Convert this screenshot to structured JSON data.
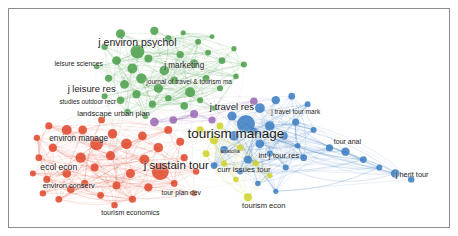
{
  "app": {
    "title": "VOSviewer co-citation network map",
    "frame_border_color": "#8c8c8c",
    "background_color": "#ffffff"
  },
  "clusters": [
    {
      "id": "green",
      "name": "psychology-marketing-cluster",
      "color": "#4da14d"
    },
    {
      "id": "red",
      "name": "environment-sustainability-cluster",
      "color": "#e04a2f"
    },
    {
      "id": "blue",
      "name": "tourism-research-cluster",
      "color": "#3f7fc1"
    },
    {
      "id": "yellow",
      "name": "tourism-economics-cluster",
      "color": "#cfd42a"
    },
    {
      "id": "purple",
      "name": "urban-planning-cluster",
      "color": "#9b6bb5"
    }
  ],
  "chart_data": {
    "type": "scatter",
    "xlabel": "",
    "ylabel": "",
    "xlim": [
      0,
      442
    ],
    "ylim": [
      0,
      220
    ],
    "grid": false,
    "legend": "none",
    "labels": [
      {
        "text": "j environ psychol",
        "x": 129,
        "y": 33,
        "size": 10.5,
        "cluster": "green"
      },
      {
        "text": "leisure sciences",
        "x": 70,
        "y": 55,
        "size": 6.8,
        "cluster": "green"
      },
      {
        "text": "j marketing",
        "x": 176,
        "y": 58,
        "size": 8.2,
        "cluster": "green"
      },
      {
        "text": "journal of travel & tourism ma",
        "x": 181,
        "y": 74,
        "size": 6.6,
        "cluster": "green"
      },
      {
        "text": "j leisure res",
        "x": 83,
        "y": 81,
        "size": 9.4,
        "cluster": "green"
      },
      {
        "text": "studies outdoor recr",
        "x": 79,
        "y": 94,
        "size": 6.4,
        "cluster": "red"
      },
      {
        "text": "landscape urban plan",
        "x": 105,
        "y": 106,
        "size": 7.6,
        "cluster": "purple"
      },
      {
        "text": "j travel res",
        "x": 224,
        "y": 99,
        "size": 9.6,
        "cluster": "blue"
      },
      {
        "text": "j travel tour mark",
        "x": 288,
        "y": 104,
        "size": 6.6,
        "cluster": "blue"
      },
      {
        "text": "environ manage",
        "x": 70,
        "y": 131,
        "size": 8.2,
        "cluster": "red"
      },
      {
        "text": "tourism manage",
        "x": 228,
        "y": 126,
        "size": 13.5,
        "cluster": "blue"
      },
      {
        "text": "anatolia",
        "x": 222,
        "y": 144,
        "size": 5.6,
        "cluster": "yellow"
      },
      {
        "text": "int j tour res",
        "x": 271,
        "y": 148,
        "size": 7.8,
        "cluster": "blue"
      },
      {
        "text": "tour anal",
        "x": 340,
        "y": 133,
        "size": 7.0,
        "cluster": "blue"
      },
      {
        "text": "ecol econ",
        "x": 50,
        "y": 159,
        "size": 8.6,
        "cluster": "red"
      },
      {
        "text": "j sustain tour",
        "x": 168,
        "y": 158,
        "size": 11.5,
        "cluster": "red"
      },
      {
        "text": "curr issues tour",
        "x": 236,
        "y": 162,
        "size": 7.8,
        "cluster": "blue"
      },
      {
        "text": "environ conserv",
        "x": 60,
        "y": 179,
        "size": 7.4,
        "cluster": "red"
      },
      {
        "text": "j herit tour",
        "x": 405,
        "y": 168,
        "size": 7.4,
        "cluster": "blue"
      },
      {
        "text": "tour plan dev",
        "x": 173,
        "y": 186,
        "size": 6.8,
        "cluster": "red"
      },
      {
        "text": "tourism econ",
        "x": 256,
        "y": 199,
        "size": 7.6,
        "cluster": "yellow"
      },
      {
        "text": "tourism economics",
        "x": 122,
        "y": 205,
        "size": 7.0,
        "cluster": "red"
      }
    ],
    "nodes": [
      {
        "x": 129,
        "y": 43,
        "r": 7.0,
        "cluster": "green"
      },
      {
        "x": 112,
        "y": 25,
        "r": 4.6,
        "cluster": "green"
      },
      {
        "x": 146,
        "y": 22,
        "r": 4.2,
        "cluster": "green"
      },
      {
        "x": 160,
        "y": 30,
        "r": 3.4,
        "cluster": "green"
      },
      {
        "x": 175,
        "y": 24,
        "r": 2.6,
        "cluster": "green"
      },
      {
        "x": 190,
        "y": 33,
        "r": 3.0,
        "cluster": "green"
      },
      {
        "x": 204,
        "y": 28,
        "r": 2.4,
        "cluster": "green"
      },
      {
        "x": 96,
        "y": 38,
        "r": 3.2,
        "cluster": "green"
      },
      {
        "x": 108,
        "y": 52,
        "r": 4.4,
        "cluster": "green"
      },
      {
        "x": 124,
        "y": 60,
        "r": 5.0,
        "cluster": "green"
      },
      {
        "x": 140,
        "y": 50,
        "r": 4.0,
        "cluster": "green"
      },
      {
        "x": 156,
        "y": 62,
        "r": 4.8,
        "cluster": "green"
      },
      {
        "x": 172,
        "y": 46,
        "r": 3.6,
        "cluster": "green"
      },
      {
        "x": 186,
        "y": 55,
        "r": 4.2,
        "cluster": "green"
      },
      {
        "x": 200,
        "y": 44,
        "r": 3.0,
        "cluster": "green"
      },
      {
        "x": 214,
        "y": 52,
        "r": 3.4,
        "cluster": "green"
      },
      {
        "x": 226,
        "y": 40,
        "r": 2.6,
        "cluster": "green"
      },
      {
        "x": 236,
        "y": 56,
        "r": 3.0,
        "cluster": "green"
      },
      {
        "x": 88,
        "y": 58,
        "r": 2.8,
        "cluster": "green"
      },
      {
        "x": 100,
        "y": 70,
        "r": 3.6,
        "cluster": "green"
      },
      {
        "x": 116,
        "y": 76,
        "r": 4.4,
        "cluster": "green"
      },
      {
        "x": 133,
        "y": 70,
        "r": 5.2,
        "cluster": "green"
      },
      {
        "x": 150,
        "y": 80,
        "r": 4.6,
        "cluster": "green"
      },
      {
        "x": 166,
        "y": 72,
        "r": 4.0,
        "cluster": "green"
      },
      {
        "x": 182,
        "y": 84,
        "r": 5.0,
        "cluster": "green"
      },
      {
        "x": 198,
        "y": 70,
        "r": 3.4,
        "cluster": "green"
      },
      {
        "x": 212,
        "y": 80,
        "r": 3.0,
        "cluster": "green"
      },
      {
        "x": 228,
        "y": 68,
        "r": 2.8,
        "cluster": "green"
      },
      {
        "x": 96,
        "y": 88,
        "r": 3.0,
        "cluster": "green"
      },
      {
        "x": 112,
        "y": 92,
        "r": 3.8,
        "cluster": "green"
      },
      {
        "x": 128,
        "y": 86,
        "r": 4.2,
        "cluster": "green"
      },
      {
        "x": 144,
        "y": 96,
        "r": 3.6,
        "cluster": "green"
      },
      {
        "x": 160,
        "y": 90,
        "r": 3.2,
        "cluster": "green"
      },
      {
        "x": 176,
        "y": 98,
        "r": 3.8,
        "cluster": "green"
      },
      {
        "x": 192,
        "y": 92,
        "r": 3.0,
        "cluster": "green"
      },
      {
        "x": 206,
        "y": 100,
        "r": 2.6,
        "cluster": "green"
      },
      {
        "x": 119,
        "y": 104,
        "r": 3.2,
        "cluster": "green"
      },
      {
        "x": 137,
        "y": 108,
        "r": 3.0,
        "cluster": "green"
      },
      {
        "x": 93,
        "y": 112,
        "r": 3.4,
        "cluster": "red"
      },
      {
        "x": 58,
        "y": 122,
        "r": 5.0,
        "cluster": "red"
      },
      {
        "x": 40,
        "y": 118,
        "r": 3.6,
        "cluster": "red"
      },
      {
        "x": 28,
        "y": 130,
        "r": 3.2,
        "cluster": "red"
      },
      {
        "x": 44,
        "y": 140,
        "r": 4.2,
        "cluster": "red"
      },
      {
        "x": 30,
        "y": 150,
        "r": 3.4,
        "cluster": "red"
      },
      {
        "x": 24,
        "y": 166,
        "r": 3.0,
        "cluster": "red"
      },
      {
        "x": 38,
        "y": 172,
        "r": 3.6,
        "cluster": "red"
      },
      {
        "x": 34,
        "y": 186,
        "r": 3.2,
        "cluster": "red"
      },
      {
        "x": 50,
        "y": 192,
        "r": 3.4,
        "cluster": "red"
      },
      {
        "x": 62,
        "y": 182,
        "r": 3.8,
        "cluster": "red"
      },
      {
        "x": 58,
        "y": 166,
        "r": 4.4,
        "cluster": "red"
      },
      {
        "x": 72,
        "y": 150,
        "r": 5.2,
        "cluster": "red"
      },
      {
        "x": 88,
        "y": 136,
        "r": 6.5,
        "cluster": "red"
      },
      {
        "x": 74,
        "y": 122,
        "r": 4.4,
        "cluster": "red"
      },
      {
        "x": 104,
        "y": 126,
        "r": 4.8,
        "cluster": "red"
      },
      {
        "x": 118,
        "y": 136,
        "r": 5.4,
        "cluster": "red"
      },
      {
        "x": 102,
        "y": 148,
        "r": 4.6,
        "cluster": "red"
      },
      {
        "x": 86,
        "y": 160,
        "r": 4.0,
        "cluster": "red"
      },
      {
        "x": 76,
        "y": 176,
        "r": 3.6,
        "cluster": "red"
      },
      {
        "x": 92,
        "y": 188,
        "r": 3.4,
        "cluster": "red"
      },
      {
        "x": 108,
        "y": 178,
        "r": 4.0,
        "cluster": "red"
      },
      {
        "x": 122,
        "y": 166,
        "r": 4.6,
        "cluster": "red"
      },
      {
        "x": 136,
        "y": 152,
        "r": 5.0,
        "cluster": "red"
      },
      {
        "x": 134,
        "y": 128,
        "r": 4.4,
        "cluster": "red"
      },
      {
        "x": 150,
        "y": 140,
        "r": 4.8,
        "cluster": "red"
      },
      {
        "x": 152,
        "y": 164,
        "r": 8.5,
        "cluster": "red"
      },
      {
        "x": 140,
        "y": 180,
        "r": 4.2,
        "cluster": "red"
      },
      {
        "x": 124,
        "y": 192,
        "r": 3.6,
        "cluster": "red"
      },
      {
        "x": 106,
        "y": 198,
        "r": 3.2,
        "cluster": "red"
      },
      {
        "x": 160,
        "y": 122,
        "r": 4.0,
        "cluster": "red"
      },
      {
        "x": 172,
        "y": 134,
        "r": 4.0,
        "cluster": "red"
      },
      {
        "x": 176,
        "y": 150,
        "r": 3.6,
        "cluster": "red"
      },
      {
        "x": 166,
        "y": 176,
        "r": 3.4,
        "cluster": "red"
      },
      {
        "x": 188,
        "y": 164,
        "r": 3.2,
        "cluster": "red"
      },
      {
        "x": 186,
        "y": 186,
        "r": 3.0,
        "cluster": "red"
      },
      {
        "x": 146,
        "y": 114,
        "r": 4.4,
        "cluster": "purple"
      },
      {
        "x": 165,
        "y": 112,
        "r": 3.8,
        "cluster": "purple"
      },
      {
        "x": 186,
        "y": 106,
        "r": 4.0,
        "cluster": "purple"
      },
      {
        "x": 204,
        "y": 112,
        "r": 3.6,
        "cluster": "purple"
      },
      {
        "x": 246,
        "y": 93,
        "r": 3.8,
        "cluster": "purple"
      },
      {
        "x": 206,
        "y": 132,
        "r": 4.4,
        "cluster": "yellow"
      },
      {
        "x": 198,
        "y": 146,
        "r": 3.4,
        "cluster": "yellow"
      },
      {
        "x": 216,
        "y": 156,
        "r": 3.0,
        "cluster": "yellow"
      },
      {
        "x": 192,
        "y": 122,
        "r": 3.6,
        "cluster": "yellow"
      },
      {
        "x": 232,
        "y": 140,
        "r": 3.2,
        "cluster": "yellow"
      },
      {
        "x": 248,
        "y": 156,
        "r": 3.0,
        "cluster": "yellow"
      },
      {
        "x": 240,
        "y": 190,
        "r": 4.0,
        "cluster": "yellow"
      },
      {
        "x": 228,
        "y": 172,
        "r": 2.8,
        "cluster": "yellow"
      },
      {
        "x": 212,
        "y": 118,
        "r": 3.4,
        "cluster": "yellow"
      },
      {
        "x": 262,
        "y": 168,
        "r": 2.6,
        "cluster": "yellow"
      },
      {
        "x": 238,
        "y": 116,
        "r": 9.0,
        "cluster": "blue"
      },
      {
        "x": 224,
        "y": 108,
        "r": 4.6,
        "cluster": "blue"
      },
      {
        "x": 252,
        "y": 100,
        "r": 5.0,
        "cluster": "blue"
      },
      {
        "x": 268,
        "y": 92,
        "r": 4.2,
        "cluster": "blue"
      },
      {
        "x": 284,
        "y": 88,
        "r": 3.4,
        "cluster": "blue"
      },
      {
        "x": 300,
        "y": 96,
        "r": 3.0,
        "cluster": "blue"
      },
      {
        "x": 262,
        "y": 118,
        "r": 4.8,
        "cluster": "blue"
      },
      {
        "x": 276,
        "y": 128,
        "r": 4.0,
        "cluster": "blue"
      },
      {
        "x": 252,
        "y": 136,
        "r": 4.4,
        "cluster": "blue"
      },
      {
        "x": 240,
        "y": 152,
        "r": 4.0,
        "cluster": "blue"
      },
      {
        "x": 226,
        "y": 128,
        "r": 5.0,
        "cluster": "blue"
      },
      {
        "x": 288,
        "y": 114,
        "r": 3.6,
        "cluster": "blue"
      },
      {
        "x": 306,
        "y": 122,
        "r": 3.0,
        "cluster": "blue"
      },
      {
        "x": 322,
        "y": 140,
        "r": 3.6,
        "cluster": "blue"
      },
      {
        "x": 338,
        "y": 144,
        "r": 4.2,
        "cluster": "blue"
      },
      {
        "x": 356,
        "y": 152,
        "r": 3.4,
        "cluster": "blue"
      },
      {
        "x": 372,
        "y": 160,
        "r": 3.0,
        "cluster": "blue"
      },
      {
        "x": 388,
        "y": 166,
        "r": 4.4,
        "cluster": "blue"
      },
      {
        "x": 404,
        "y": 172,
        "r": 3.2,
        "cluster": "blue"
      },
      {
        "x": 296,
        "y": 150,
        "r": 3.4,
        "cluster": "blue"
      },
      {
        "x": 278,
        "y": 160,
        "r": 3.0,
        "cluster": "blue"
      },
      {
        "x": 262,
        "y": 146,
        "r": 3.2,
        "cluster": "blue"
      },
      {
        "x": 250,
        "y": 176,
        "r": 2.8,
        "cluster": "blue"
      },
      {
        "x": 268,
        "y": 184,
        "r": 2.6,
        "cluster": "blue"
      },
      {
        "x": 216,
        "y": 142,
        "r": 3.8,
        "cluster": "blue"
      },
      {
        "x": 206,
        "y": 158,
        "r": 3.4,
        "cluster": "blue"
      },
      {
        "x": 232,
        "y": 164,
        "r": 3.0,
        "cluster": "blue"
      },
      {
        "x": 290,
        "y": 138,
        "r": 2.8,
        "cluster": "blue"
      },
      {
        "x": 246,
        "y": 124,
        "r": 4.0,
        "cluster": "blue"
      }
    ]
  }
}
